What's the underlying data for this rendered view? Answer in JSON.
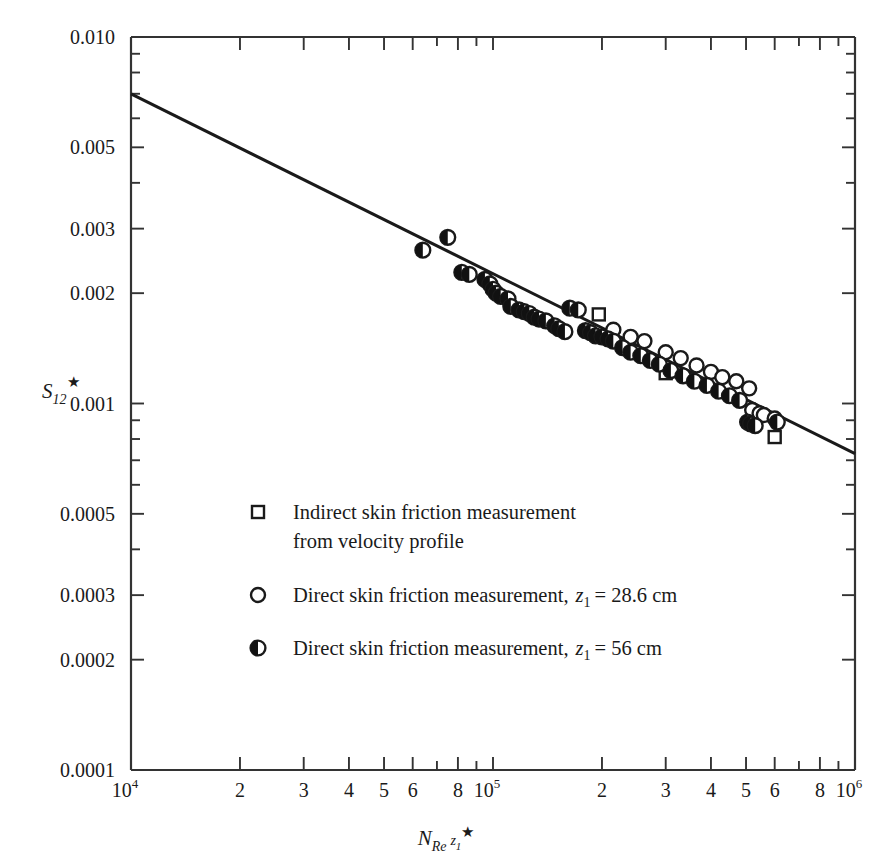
{
  "chart_data": {
    "type": "scatter",
    "title": "",
    "xlabel": "N_Re z_1*",
    "ylabel": "S_12*",
    "xscale": "log",
    "yscale": "log",
    "xlim": [
      10000,
      1000000
    ],
    "ylim": [
      0.0001,
      0.01
    ],
    "grid": false,
    "legend_position": "inside-lower-left",
    "x_tick_labels": [
      "10",
      "2",
      "3",
      "4",
      "5",
      "6",
      "8",
      "10",
      "2",
      "3",
      "4",
      "5",
      "6",
      "8",
      "10"
    ],
    "x_tick_exponents": [
      "4",
      "",
      "",
      "",
      "",
      "",
      "",
      "5",
      "",
      "",
      "",
      "",
      "",
      "",
      "6"
    ],
    "x_tick_values": [
      10000,
      20000,
      30000,
      40000,
      50000,
      60000,
      80000,
      100000,
      200000,
      300000,
      400000,
      500000,
      600000,
      800000,
      1000000
    ],
    "y_tick_labels": [
      "0.010",
      "0.005",
      "0.003",
      "0.002",
      "0.001",
      "0.0005",
      "0.0003",
      "0.0002",
      "0.0001"
    ],
    "y_tick_values": [
      0.01,
      0.005,
      0.003,
      0.002,
      0.001,
      0.0005,
      0.0003,
      0.0002,
      0.0001
    ],
    "fit_line": {
      "label": "correlation line",
      "x": [
        10000,
        1000000
      ],
      "y": [
        0.007,
        0.00073
      ]
    },
    "series": [
      {
        "name": "Indirect skin friction measurement from velocity profile",
        "marker": "open-square",
        "points": [
          [
            196000,
            0.00175
          ],
          [
            300000,
            0.00121
          ],
          [
            600000,
            0.00081
          ]
        ]
      },
      {
        "name": "Direct skin friction measurement, z1 = 28.6 cm",
        "marker": "open-circle",
        "points": [
          [
            215000,
            0.00159
          ],
          [
            240000,
            0.00152
          ],
          [
            262000,
            0.00148
          ],
          [
            300000,
            0.00138
          ],
          [
            330000,
            0.00133
          ],
          [
            365000,
            0.00127
          ],
          [
            400000,
            0.00122
          ],
          [
            430000,
            0.00118
          ],
          [
            470000,
            0.00115
          ],
          [
            510000,
            0.0011
          ],
          [
            520000,
            0.00096
          ],
          [
            545000,
            0.00094
          ],
          [
            560000,
            0.00093
          ],
          [
            600000,
            0.00091
          ]
        ]
      },
      {
        "name": "Direct skin friction measurement, z1 = 56 cm",
        "marker": "half-filled-circle",
        "points": [
          [
            64000,
            0.00262
          ],
          [
            75000,
            0.00284
          ],
          [
            82000,
            0.00228
          ],
          [
            86000,
            0.00225
          ],
          [
            95000,
            0.00218
          ],
          [
            98000,
            0.00212
          ],
          [
            100000,
            0.00205
          ],
          [
            102000,
            0.002
          ],
          [
            105000,
            0.00196
          ],
          [
            110000,
            0.00193
          ],
          [
            112000,
            0.00184
          ],
          [
            118000,
            0.0018
          ],
          [
            122000,
            0.00178
          ],
          [
            126000,
            0.00176
          ],
          [
            130000,
            0.00172
          ],
          [
            134000,
            0.0017
          ],
          [
            140000,
            0.00168
          ],
          [
            148000,
            0.00163
          ],
          [
            152000,
            0.0016
          ],
          [
            158000,
            0.00157
          ],
          [
            163000,
            0.00182
          ],
          [
            172000,
            0.0018
          ],
          [
            180000,
            0.00158
          ],
          [
            186000,
            0.00156
          ],
          [
            192000,
            0.00153
          ],
          [
            200000,
            0.00152
          ],
          [
            208000,
            0.0015
          ],
          [
            215000,
            0.00148
          ],
          [
            228000,
            0.00142
          ],
          [
            240000,
            0.00138
          ],
          [
            256000,
            0.00135
          ],
          [
            272000,
            0.00131
          ],
          [
            288000,
            0.00128
          ],
          [
            310000,
            0.00123
          ],
          [
            335000,
            0.00119
          ],
          [
            360000,
            0.00115
          ],
          [
            390000,
            0.00112
          ],
          [
            420000,
            0.00108
          ],
          [
            450000,
            0.00105
          ],
          [
            480000,
            0.00102
          ],
          [
            505000,
            0.00089
          ],
          [
            515000,
            0.00088
          ],
          [
            530000,
            0.00087
          ],
          [
            610000,
            0.00089
          ]
        ]
      }
    ]
  },
  "axes": {
    "y_title_base": "S",
    "y_title_sub": "12",
    "y_title_star": "★",
    "x_title_base": "N",
    "x_title_sub": "Re",
    "x_title_var": "z",
    "x_title_var_sub": "1",
    "x_title_star": "★"
  },
  "legend": {
    "entries": [
      {
        "marker": "open-square",
        "line1": "Indirect skin friction measurement",
        "line2": "from velocity profile",
        "var": "",
        "var_sub": "",
        "value": ""
      },
      {
        "marker": "open-circle",
        "line1": "Direct skin friction measurement,",
        "line2": "",
        "var": "z",
        "var_sub": "1",
        "value": "= 28.6 cm"
      },
      {
        "marker": "half-filled-circle",
        "line1": "Direct skin friction measurement,",
        "line2": "",
        "var": "z",
        "var_sub": "1",
        "value": "= 56 cm"
      }
    ]
  },
  "colors": {
    "ink": "#1a1a1a",
    "axis": "#333333",
    "marker_fill": "#111111",
    "background": "#ffffff"
  }
}
